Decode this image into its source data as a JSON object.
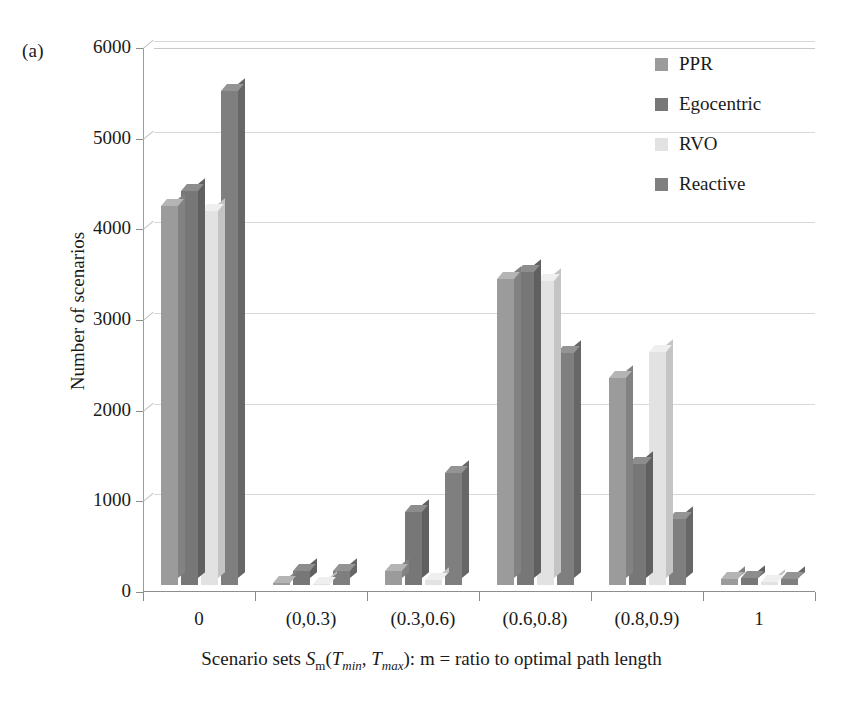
{
  "figure": {
    "panel_label": "(a)"
  },
  "chart_data": {
    "type": "bar",
    "title": "",
    "subtitle": "",
    "xlabel_plain": "Scenario sets S_m(T_min, T_max): m = ratio to optimal path length",
    "xlabel_parts": {
      "lead": "Scenario sets ",
      "s_italic": "S",
      "s_sub": "m",
      "paren_open": "(",
      "t1_italic": "T",
      "t1_sub": "min",
      "comma": ", ",
      "t2_italic": "T",
      "t2_sub": "max",
      "paren_close": ")",
      "tail": ": m = ratio to optimal path length"
    },
    "ylabel": "Number of scenarios",
    "categories": [
      "0",
      "(0,0.3)",
      "(0.3,0.6)",
      "(0.6,0.8)",
      "(0.8,0.9)",
      "1"
    ],
    "yticks": [
      0,
      1000,
      2000,
      3000,
      4000,
      5000,
      6000
    ],
    "ytick_labels": [
      "0",
      "1000",
      "2000",
      "3000",
      "4000",
      "5000",
      "6000"
    ],
    "ylim": [
      0,
      6000
    ],
    "grid": true,
    "legend_position": "top-right",
    "series": [
      {
        "name": "PPR",
        "color": "#9b9b9b",
        "side_color": "#828282",
        "top_color": "#b4b4b4",
        "values": [
          4180,
          20,
          150,
          3370,
          2280,
          70
        ]
      },
      {
        "name": "Egocentric",
        "color": "#777777",
        "side_color": "#606060",
        "top_color": "#8d8d8d",
        "values": [
          4350,
          150,
          800,
          3450,
          1340,
          80
        ]
      },
      {
        "name": "RVO",
        "color": "#e2e2e2",
        "side_color": "#c4c4c4",
        "top_color": "#efefef",
        "values": [
          4120,
          15,
          50,
          3350,
          2570,
          30
        ]
      },
      {
        "name": "Reactive",
        "color": "#7f7f7f",
        "side_color": "#676767",
        "top_color": "#949494",
        "values": [
          5450,
          150,
          1230,
          2560,
          730,
          70
        ]
      }
    ]
  }
}
